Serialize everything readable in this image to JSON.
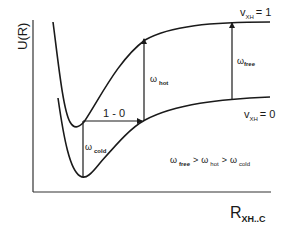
{
  "diagram": {
    "y_axis": {
      "label": "U(R)"
    },
    "x_axis": {
      "label_main": "R",
      "label_sub": "XH..C"
    },
    "curves": [
      {
        "name": "upper",
        "label_main": "v",
        "label_sub": "XH",
        "label_suffix": "= 1"
      },
      {
        "name": "lower",
        "label_main": "v",
        "label_sub": "XH",
        "label_suffix": "= 0"
      }
    ],
    "transitions": [
      {
        "name": "cold",
        "symbol": "ω",
        "sub": "cold"
      },
      {
        "name": "hot",
        "symbol": "ω",
        "sub": "hot"
      },
      {
        "name": "free",
        "symbol": "ω",
        "sub": "free"
      }
    ],
    "horizontal_arrow": {
      "label": "1 - 0"
    },
    "relation": {
      "w1": "ω",
      "s1": "free",
      "gt1": ">",
      "w2": "ω",
      "s2": "hot",
      "gt2": ">",
      "w3": "ω",
      "s3": "cold"
    },
    "colors": {
      "ink": "#1a1a1a",
      "background": "#ffffff"
    }
  }
}
